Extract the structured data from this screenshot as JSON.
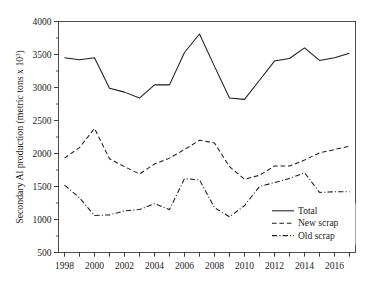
{
  "chart_data": {
    "type": "line",
    "title": "",
    "xlabel": "",
    "ylabel": "Secondary Al production (metric tons x 10",
    "ylabel_exponent": "3",
    "ylabel_suffix": ")",
    "x": [
      1998,
      1999,
      2000,
      2001,
      2002,
      2003,
      2004,
      2005,
      2006,
      2007,
      2008,
      2009,
      2010,
      2011,
      2012,
      2013,
      2014,
      2015,
      2016,
      2017
    ],
    "xlim": [
      1997.6,
      2017.4
    ],
    "ylim": [
      500,
      4000
    ],
    "yticks": [
      500,
      1000,
      1500,
      2000,
      2500,
      3000,
      3500,
      4000
    ],
    "xticks": [
      1998,
      1999,
      2000,
      2001,
      2002,
      2003,
      2004,
      2005,
      2006,
      2007,
      2008,
      2009,
      2010,
      2011,
      2012,
      2013,
      2014,
      2015,
      2016,
      2017
    ],
    "xtick_labels": [
      "1998",
      "",
      "2000",
      "",
      "2002",
      "",
      "2004",
      "",
      "2006",
      "",
      "2008",
      "",
      "2010",
      "",
      "2012",
      "",
      "2014",
      "",
      "2016",
      ""
    ],
    "ytick_labels": [
      "500",
      "1000",
      "1500",
      "2000",
      "2500",
      "3000",
      "3500",
      "4000"
    ],
    "grid": false,
    "legend_position": "bottom-right",
    "series": [
      {
        "name": "Total",
        "style": "solid",
        "color": "#1c1c1c",
        "values": [
          3450,
          3420,
          3450,
          2990,
          2930,
          2840,
          3040,
          3040,
          3530,
          3810,
          3320,
          2840,
          2820,
          3110,
          3400,
          3440,
          3600,
          3410,
          3450,
          3520
        ]
      },
      {
        "name": "New scrap",
        "style": "dashed",
        "color": "#1c1c1c",
        "values": [
          1930,
          2090,
          2380,
          1920,
          1800,
          1690,
          1840,
          1930,
          2060,
          2200,
          2160,
          1800,
          1610,
          1670,
          1810,
          1810,
          1900,
          2010,
          2060,
          2110
        ]
      },
      {
        "name": "Old scrap",
        "style": "dashdot",
        "color": "#1c1c1c",
        "values": [
          1520,
          1330,
          1060,
          1070,
          1130,
          1150,
          1240,
          1150,
          1620,
          1600,
          1180,
          1040,
          1210,
          1500,
          1560,
          1620,
          1710,
          1410,
          1420,
          1420
        ]
      }
    ],
    "legend_entries": [
      "Total",
      "New scrap",
      "Old scrap"
    ]
  }
}
